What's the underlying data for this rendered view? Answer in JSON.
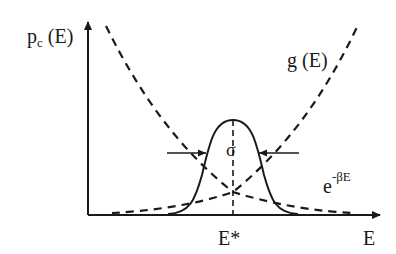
{
  "diagram": {
    "y_axis_label": {
      "main": "p",
      "sub": "c",
      "rest": " (E)"
    },
    "x_axis_label": "E",
    "peak_label": "E*",
    "width_label": "σ",
    "curves": {
      "density_of_states": "g (E)",
      "boltzmann": {
        "base": "e",
        "exponent": "-βE"
      },
      "product": "p_c (E)"
    },
    "colors": {
      "line": "#1a1a1a",
      "background": "#ffffff"
    }
  }
}
